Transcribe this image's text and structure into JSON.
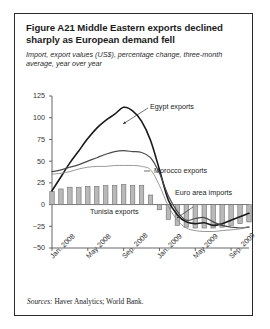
{
  "figure": {
    "title": "Figure A21  Middle Eastern exports declined sharply as European demand fell",
    "subtitle": "Import, export values (US$), percentage change, three-month average, year over year",
    "source_label": "Sources:",
    "source_text": " Haver Analytics; World Bank."
  },
  "annotations": {
    "egypt": "Egypt exports",
    "morocco": "Morocco exports",
    "tunisia": "Tunisia exports",
    "euro": "Euro area imports"
  },
  "colors": {
    "egypt": "#1a1a1a",
    "morocco": "#4a4a4a",
    "tunisia": "#8c8c8c",
    "bar_fill": "#b9b9b9",
    "bar_stroke": "#6e6e6e",
    "axis": "#555555",
    "frame": "#2b2b2b"
  },
  "chart_data": {
    "type": "line",
    "title": "Figure A21  Middle Eastern exports declined sharply as European demand fell",
    "subtitle": "Import, export values (US$), percentage change, three-month average, year over year",
    "xlabel": "",
    "ylabel": "",
    "ylim": [
      -50,
      125
    ],
    "yticks": [
      125,
      100,
      75,
      50,
      25,
      0,
      -25,
      -50
    ],
    "ytick_labels": [
      "125",
      "100",
      "75",
      "50",
      "25",
      "0",
      "−25",
      "−50"
    ],
    "grid": false,
    "legend": "in-plot annotations",
    "x": [
      "Jan. 2008",
      "Feb. 2008",
      "Mar. 2008",
      "Apr. 2008",
      "May 2008",
      "Jun. 2008",
      "Jul. 2008",
      "Aug. 2008",
      "Sep. 2008",
      "Oct. 2008",
      "Nov. 2008",
      "Dec. 2008",
      "Jan. 2009",
      "Feb. 2009",
      "Mar. 2009",
      "Apr. 2009",
      "May 2009",
      "Jun. 2009",
      "Jul. 2009",
      "Aug. 2009",
      "Sep. 2009",
      "Oct. 2009",
      "Nov. 2009"
    ],
    "xtick_labels": [
      "Jan. 2008",
      "May 2008",
      "Sep. 2008",
      "Jan. 2009",
      "May 2009",
      "Sep. 2009"
    ],
    "xtick_positions": [
      0,
      4,
      8,
      12,
      16,
      20
    ],
    "series": [
      {
        "name": "Egypt exports",
        "type": "line",
        "values": [
          16,
          32,
          48,
          62,
          76,
          88,
          97,
          104,
          112,
          108,
          96,
          74,
          40,
          5,
          -12,
          -20,
          -22,
          -21,
          -24,
          -22,
          -18,
          -14,
          -10
        ]
      },
      {
        "name": "Morocco exports",
        "type": "line",
        "values": [
          38,
          40,
          43,
          46,
          50,
          54,
          58,
          61,
          62,
          61,
          60,
          54,
          36,
          10,
          -8,
          -18,
          -16,
          -15,
          -20,
          -24,
          -26,
          -27,
          -26
        ]
      },
      {
        "name": "Tunisia exports",
        "type": "line",
        "values": [
          35,
          36,
          38,
          41,
          43,
          44,
          44,
          45,
          45,
          45,
          44,
          40,
          22,
          -2,
          -18,
          -27,
          -30,
          -31,
          -31,
          -30,
          -29,
          -28,
          -25
        ]
      },
      {
        "name": "Euro area imports",
        "type": "bar",
        "values": [
          15,
          18,
          20,
          20,
          21,
          21,
          22,
          22,
          23,
          22,
          22,
          11,
          -6,
          -17,
          -24,
          -26,
          -27,
          -27,
          -27,
          -26,
          -24,
          -22,
          -20
        ]
      }
    ]
  }
}
